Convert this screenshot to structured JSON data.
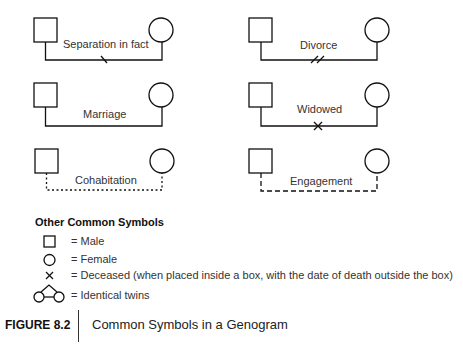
{
  "relationships": [
    {
      "label": "Separation in fact",
      "line": "solid",
      "marker": "single-slash"
    },
    {
      "label": "Divorce",
      "line": "solid",
      "marker": "double-slash"
    },
    {
      "label": "Marriage",
      "line": "solid",
      "marker": "none"
    },
    {
      "label": "Widowed",
      "line": "solid",
      "marker": "x"
    },
    {
      "label": "Cohabitation",
      "line": "dotted",
      "marker": "none"
    },
    {
      "label": "Engagement",
      "line": "dashed",
      "marker": "none"
    }
  ],
  "legend": {
    "title": "Other Common Symbols",
    "items": [
      {
        "symbol": "square",
        "label": "= Male"
      },
      {
        "symbol": "circle",
        "label": "= Female"
      },
      {
        "symbol": "x",
        "label": "= Deceased (when placed inside a box, with the date of death outside the box)"
      },
      {
        "symbol": "twins",
        "label": "= Identical twins"
      }
    ]
  },
  "figure": {
    "number": "FIGURE 8.2",
    "caption": "Common Symbols in a Genogram"
  },
  "colors": {
    "stroke": "#111111",
    "text": "#333333",
    "background": "#ffffff"
  }
}
